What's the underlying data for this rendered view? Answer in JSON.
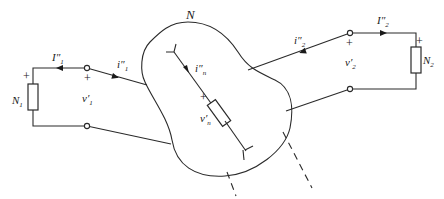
{
  "diagram": {
    "network_label": "N",
    "left_port": {
      "load_label": "N",
      "load_sub": "1",
      "outer_current_label": "I″",
      "outer_current_sub": "1",
      "inner_current_label": "i″",
      "inner_current_sub": "1",
      "voltage_label": "v′",
      "voltage_sub": "1",
      "plus_load": "+",
      "plus_terminal": "+"
    },
    "right_port": {
      "load_label": "N",
      "load_sub": "2",
      "outer_current_label": "I″",
      "outer_current_sub": "2",
      "inner_current_label": "i″",
      "inner_current_sub": "2",
      "voltage_label": "v′",
      "voltage_sub": "2",
      "plus_load": "+",
      "plus_terminal": "+"
    },
    "internal_branch": {
      "current_label": "i″",
      "current_sub": "n",
      "voltage_label": "v′",
      "voltage_sub": "n",
      "plus": "+"
    }
  }
}
